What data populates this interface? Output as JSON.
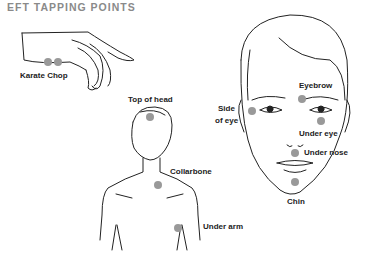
{
  "title": "EFT TAPPING POINTS",
  "dot_color": "#999999",
  "line_color": "#222222",
  "points": [
    {
      "label": "Karate Chop"
    },
    {
      "label": "Top of head"
    },
    {
      "label": "Collarbone"
    },
    {
      "label": "Under arm"
    },
    {
      "label": "Side"
    },
    {
      "label": "of eye"
    },
    {
      "label": "Eyebrow"
    },
    {
      "label": "Under eye"
    },
    {
      "label": "Under nose"
    },
    {
      "label": "Chin"
    }
  ],
  "figures": [
    "hand",
    "upper body",
    "face"
  ]
}
